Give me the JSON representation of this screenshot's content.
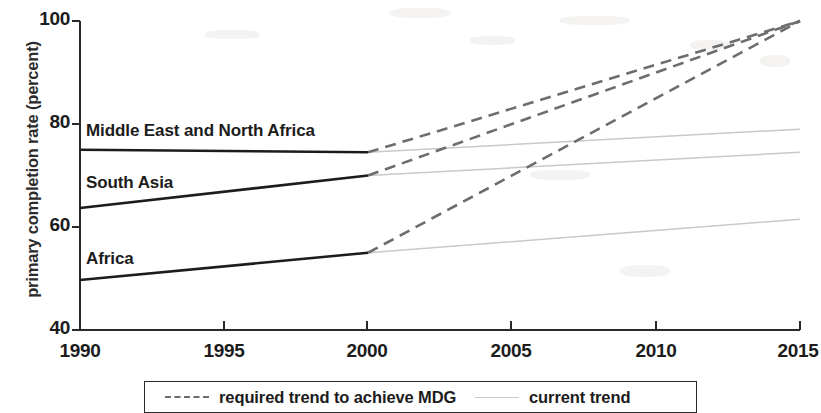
{
  "chart_data": {
    "type": "line",
    "title": "",
    "xlabel": "",
    "ylabel": "primary completion rate (percent)",
    "xlim": [
      1990,
      2015
    ],
    "ylim": [
      40,
      100
    ],
    "grid": false,
    "x_ticks": [
      "1990",
      "1995",
      "2000",
      "2005",
      "2010",
      "2015"
    ],
    "y_ticks": [
      "40",
      "60",
      "80",
      "100"
    ],
    "legend_position": "bottom",
    "legend": [
      {
        "label": "required trend to achieve MDG",
        "style": "dashed",
        "color": "#6d6d6d"
      },
      {
        "label": "current trend",
        "style": "solid",
        "color": "#c9c9c9"
      }
    ],
    "series": [
      {
        "name": "Middle East and North Africa",
        "historical": {
          "x": [
            1990,
            2000
          ],
          "values": [
            75.0,
            74.5
          ],
          "style": "solid",
          "color": "#1c1c1c"
        },
        "required_trend": {
          "x": [
            2000,
            2015
          ],
          "values": [
            74.5,
            100.0
          ],
          "style": "dashed",
          "color": "#6d6d6d"
        },
        "current_trend": {
          "x": [
            2000,
            2015
          ],
          "values": [
            74.5,
            79.0
          ],
          "style": "solid",
          "color": "#c9c9c9"
        }
      },
      {
        "name": "South Asia",
        "historical": {
          "x": [
            1990,
            2000
          ],
          "values": [
            63.7,
            70.0
          ],
          "style": "solid",
          "color": "#1c1c1c"
        },
        "required_trend": {
          "x": [
            2000,
            2015
          ],
          "values": [
            70.0,
            100.0
          ],
          "style": "dashed",
          "color": "#6d6d6d"
        },
        "current_trend": {
          "x": [
            2000,
            2015
          ],
          "values": [
            70.0,
            74.5
          ],
          "style": "solid",
          "color": "#c9c9c9"
        }
      },
      {
        "name": "Africa",
        "historical": {
          "x": [
            1990,
            2000
          ],
          "values": [
            49.7,
            55.0
          ],
          "style": "solid",
          "color": "#1c1c1c"
        },
        "required_trend": {
          "x": [
            2000,
            2015
          ],
          "values": [
            55.0,
            100.0
          ],
          "style": "dashed",
          "color": "#6d6d6d"
        },
        "current_trend": {
          "x": [
            2000,
            2015
          ],
          "values": [
            55.0,
            61.5
          ],
          "style": "solid",
          "color": "#c9c9c9"
        }
      }
    ],
    "annotations": [
      {
        "text": "Middle East and North Africa",
        "x": 1990.3,
        "y": 77.0
      },
      {
        "text": "South Asia",
        "x": 1990.3,
        "y": 67.5
      },
      {
        "text": "Africa",
        "x": 1990.3,
        "y": 57.5
      }
    ]
  },
  "axis": {
    "y_label": "primary completion rate (percent)"
  }
}
